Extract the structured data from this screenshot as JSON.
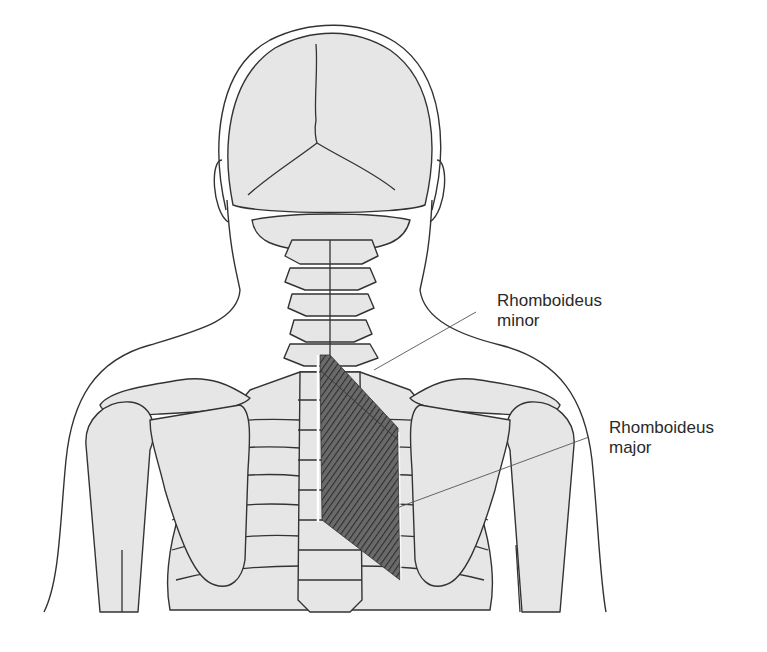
{
  "figure": {
    "highlighted_muscle": "Rhomboids",
    "colors": {
      "bone_fill": "#e6e6e6",
      "outline": "#333333",
      "muscle": "#4a4a4a",
      "background": "#ffffff",
      "label_text": "#2a2a2a"
    }
  },
  "labels": [
    {
      "id": "rhomboideus-minor",
      "line1": "Rhomboideus",
      "line2": "minor"
    },
    {
      "id": "rhomboideus-major",
      "line1": "Rhomboideus",
      "line2": "major"
    }
  ]
}
